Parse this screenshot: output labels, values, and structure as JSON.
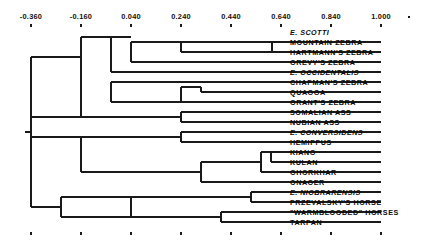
{
  "figure": {
    "type": "phylogenetic-tree-dendrogram",
    "orientation": "left-to-right",
    "line_color": "#1a1a1a",
    "background_color": "#ffffff",
    "text_color": "#101010"
  },
  "axis": {
    "position": "top-and-bottom",
    "tick_labels": [
      "-0.360",
      "-0.160",
      "0.040",
      "0.240",
      "0.440",
      "0.640",
      "0.840",
      "1.000"
    ],
    "tick_values": [
      -0.36,
      -0.16,
      0.04,
      0.24,
      0.44,
      0.64,
      0.84,
      1.0
    ],
    "tick_x_px": [
      31,
      81,
      131,
      181,
      231,
      281,
      331,
      381
    ],
    "extra_tick_x_px": [
      409
    ],
    "label_y_px": 19,
    "top_tick_y_px": 24,
    "bottom_tick_y_px": 232
  },
  "taxa": [
    {
      "index": 0,
      "label": "E. SCOTTI",
      "italic": true,
      "row_y_px": 32,
      "tip_x_px": 381
    },
    {
      "index": 1,
      "label": "MOUNTAIN ZEBRA",
      "italic": false,
      "row_y_px": 42,
      "tip_x_px": 381
    },
    {
      "index": 2,
      "label": "HARTMANN'S ZEBRA",
      "italic": false,
      "row_y_px": 52,
      "tip_x_px": 381
    },
    {
      "index": 3,
      "label": "GREVY'S ZEBRA",
      "italic": false,
      "row_y_px": 62,
      "tip_x_px": 381
    },
    {
      "index": 4,
      "label": "E. OCCIDENTALIS",
      "italic": true,
      "row_y_px": 72,
      "tip_x_px": 381
    },
    {
      "index": 5,
      "label": "CHAPMAN'S ZEBRA",
      "italic": false,
      "row_y_px": 82,
      "tip_x_px": 381
    },
    {
      "index": 6,
      "label": "QUAGGA",
      "italic": false,
      "row_y_px": 92,
      "tip_x_px": 381
    },
    {
      "index": 7,
      "label": "GRANT'S ZEBRA",
      "italic": false,
      "row_y_px": 102,
      "tip_x_px": 381
    },
    {
      "index": 8,
      "label": "SOMALIAN ASS",
      "italic": false,
      "row_y_px": 112,
      "tip_x_px": 381
    },
    {
      "index": 9,
      "label": "NUBIAN ASS",
      "italic": false,
      "row_y_px": 122,
      "tip_x_px": 381
    },
    {
      "index": 10,
      "label": "E. CONVERSIDENS",
      "italic": true,
      "row_y_px": 132,
      "tip_x_px": 381
    },
    {
      "index": 11,
      "label": "HEMIPPUS",
      "italic": false,
      "row_y_px": 142,
      "tip_x_px": 381
    },
    {
      "index": 12,
      "label": "KIANG",
      "italic": false,
      "row_y_px": 152,
      "tip_x_px": 381
    },
    {
      "index": 13,
      "label": "KULAN",
      "italic": false,
      "row_y_px": 162,
      "tip_x_px": 381
    },
    {
      "index": 14,
      "label": "GHORKHAR",
      "italic": false,
      "row_y_px": 172,
      "tip_x_px": 381
    },
    {
      "index": 15,
      "label": "ONAGER",
      "italic": false,
      "row_y_px": 182,
      "tip_x_px": 381
    },
    {
      "index": 16,
      "label": "E. NIOBRARENSIS",
      "italic": true,
      "row_y_px": 192,
      "tip_x_px": 381
    },
    {
      "index": 17,
      "label": "PRZEVALSKY'S HORSE",
      "italic": false,
      "row_y_px": 202,
      "tip_x_px": 381
    },
    {
      "index": 18,
      "label": "\"WARMBLOODED\" HORSES",
      "italic": false,
      "row_y_px": 212,
      "tip_x_px": 381
    },
    {
      "index": 19,
      "label": "TARPAN",
      "italic": false,
      "row_y_px": 222,
      "tip_x_px": 381
    }
  ],
  "label_x_px": 290,
  "nodes": [
    {
      "name": "root",
      "x_px": 31,
      "y_top_px": 57,
      "y_bot_px": 207
    },
    {
      "name": "root-stub",
      "x_px": 25,
      "y_px": 132
    },
    {
      "name": "zebra-ass-clade",
      "x_px": 81,
      "y_top_px": 37,
      "y_bot_px": 117
    },
    {
      "name": "zebra-clade",
      "x_px": 111,
      "y_top_px": 37,
      "y_bot_px": 72
    },
    {
      "name": "mountain-grevy",
      "x_px": 131,
      "y_top_px": 42,
      "y_bot_px": 62
    },
    {
      "name": "mountain-pair",
      "x_px": 181,
      "y_top_px": 42,
      "y_bot_px": 52
    },
    {
      "name": "mt-hart-split",
      "x_px": 272,
      "y_top_px": 42,
      "y_bot_px": 52
    },
    {
      "name": "plains-clade",
      "x_px": 111,
      "y_top_px": 82,
      "y_bot_px": 102
    },
    {
      "name": "quagga-grant",
      "x_px": 181,
      "y_top_px": 87,
      "y_bot_px": 102
    },
    {
      "name": "quagga-pair",
      "x_px": 201,
      "y_top_px": 87,
      "y_bot_px": 92
    },
    {
      "name": "ass-pair",
      "x_px": 181,
      "y_top_px": 112,
      "y_bot_px": 122
    },
    {
      "name": "asses-clade",
      "x_px": 81,
      "y_top_px": 137,
      "y_bot_px": 172
    },
    {
      "name": "conv-hemi",
      "x_px": 181,
      "y_top_px": 132,
      "y_bot_px": 142
    },
    {
      "name": "hemionus-clade",
      "x_px": 201,
      "y_top_px": 162,
      "y_bot_px": 182
    },
    {
      "name": "kiang-group",
      "x_px": 261,
      "y_top_px": 152,
      "y_bot_px": 172
    },
    {
      "name": "kiang-kulan",
      "x_px": 271,
      "y_top_px": 152,
      "y_bot_px": 162
    },
    {
      "name": "horse-clade",
      "x_px": 61,
      "y_top_px": 197,
      "y_bot_px": 217
    },
    {
      "name": "horse-inner",
      "x_px": 131,
      "y_top_px": 197,
      "y_bot_px": 217
    },
    {
      "name": "niobr-przev",
      "x_px": 251,
      "y_top_px": 192,
      "y_bot_px": 202
    },
    {
      "name": "warm-tarpan",
      "x_px": 221,
      "y_top_px": 212,
      "y_bot_px": 222
    }
  ]
}
